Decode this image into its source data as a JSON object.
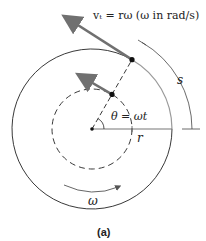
{
  "figure": {
    "caption": "(a)",
    "labels": {
      "velocity": "vₜ = rω (ω in rad/s)",
      "angle": "θ = ωt",
      "radius": "r",
      "arc": "s",
      "angular_velocity": "ω"
    },
    "colors": {
      "line": "#222222",
      "arrow": "#707070",
      "arc_gray": "#9a9a9a"
    },
    "geometry": {
      "center": [
        92,
        129
      ],
      "outer_radius": 80,
      "inner_radius": 40,
      "angle_deg": 60
    }
  }
}
